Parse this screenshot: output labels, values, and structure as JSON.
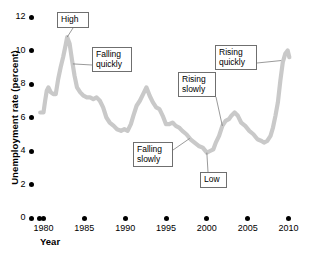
{
  "chart_data": {
    "type": "line",
    "title": "",
    "xlabel": "Year",
    "ylabel": "Unemployment rate (percent)",
    "xlim": [
      1979.5,
      2010.5
    ],
    "ylim": [
      0,
      12
    ],
    "grid": false,
    "legend_position": "none",
    "line_color": "#c9c9c9",
    "xticks": [
      1980,
      1985,
      1990,
      1995,
      2000,
      2005,
      2010
    ],
    "xtick_labels": [
      "1980",
      "1985",
      "1990",
      "1995",
      "2000",
      "2005",
      "2010"
    ],
    "yticks": [
      0,
      2,
      4,
      6,
      8,
      10,
      12
    ],
    "ytick_labels": [
      "0",
      "2",
      "4",
      "6",
      "8",
      "10",
      "12"
    ],
    "series": [
      {
        "name": "Unemployment rate",
        "x": [
          1979.6,
          1980.0,
          1980.2,
          1980.4,
          1980.6,
          1980.9,
          1981.2,
          1981.5,
          1981.8,
          1982.1,
          1982.4,
          1982.7,
          1982.9,
          1983.2,
          1983.5,
          1983.8,
          1984.1,
          1984.5,
          1984.9,
          1985.3,
          1985.7,
          1986.1,
          1986.5,
          1986.9,
          1987.3,
          1987.7,
          1988.1,
          1988.6,
          1989.0,
          1989.5,
          1989.9,
          1990.3,
          1990.7,
          1991.0,
          1991.4,
          1991.8,
          1992.2,
          1992.6,
          1993.0,
          1993.4,
          1993.8,
          1994.2,
          1994.6,
          1995.0,
          1995.4,
          1995.8,
          1996.2,
          1996.6,
          1997.0,
          1997.5,
          1998.0,
          1998.5,
          1999.0,
          1999.5,
          2000.0,
          2000.4,
          2000.8,
          2001.1,
          2001.5,
          2001.9,
          2002.3,
          2002.7,
          2003.0,
          2003.4,
          2003.8,
          2004.2,
          2004.7,
          2005.2,
          2005.7,
          2006.2,
          2006.7,
          2007.0,
          2007.4,
          2007.8,
          2008.1,
          2008.4,
          2008.7,
          2009.0,
          2009.3,
          2009.6,
          2009.9,
          2010.1
        ],
        "y": [
          6.3,
          6.3,
          7.0,
          7.6,
          7.8,
          7.5,
          7.4,
          7.4,
          8.3,
          9.0,
          9.6,
          10.3,
          10.8,
          10.4,
          9.4,
          8.5,
          7.8,
          7.5,
          7.3,
          7.2,
          7.2,
          7.1,
          7.2,
          7.0,
          6.6,
          6.0,
          5.7,
          5.5,
          5.3,
          5.2,
          5.3,
          5.2,
          5.6,
          6.1,
          6.7,
          7.0,
          7.4,
          7.8,
          7.3,
          6.9,
          6.6,
          6.5,
          6.1,
          5.6,
          5.6,
          5.7,
          5.5,
          5.4,
          5.2,
          5.0,
          4.7,
          4.5,
          4.3,
          4.2,
          3.9,
          4.0,
          4.1,
          4.5,
          4.9,
          5.5,
          5.8,
          5.9,
          6.1,
          6.3,
          6.1,
          5.7,
          5.5,
          5.2,
          5.0,
          4.7,
          4.6,
          4.5,
          4.6,
          4.9,
          5.4,
          6.1,
          6.9,
          8.2,
          9.3,
          9.8,
          10.0,
          9.6
        ]
      }
    ],
    "annotations": [
      {
        "id": "high",
        "label": "High",
        "target_x": 1982.9,
        "target_y": 10.8
      },
      {
        "id": "falling-quickly",
        "label": "Falling\nquickly",
        "target_x": 1983.6,
        "target_y": 9.2
      },
      {
        "id": "falling-slowly",
        "label": "Falling\nslowly",
        "target_x": 1997.9,
        "target_y": 4.75
      },
      {
        "id": "rising-slowly",
        "label": "Rising\nslowly",
        "target_x": 2001.9,
        "target_y": 5.5
      },
      {
        "id": "low",
        "label": "Low",
        "target_x": 2000.0,
        "target_y": 3.9
      },
      {
        "id": "rising-quickly",
        "label": "Rising\nquickly",
        "target_x": 2009.1,
        "target_y": 9.4
      }
    ]
  },
  "callouts": {
    "high": "High",
    "falling_quickly": "Falling\nquickly",
    "falling_slowly": "Falling\nslowly",
    "rising_slowly": "Rising\nslowly",
    "low": "Low",
    "rising_quickly": "Rising\nquickly"
  }
}
